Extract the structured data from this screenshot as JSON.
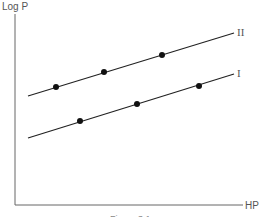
{
  "chart_data": {
    "type": "line",
    "title": "",
    "xlabel": "HP",
    "ylabel": "Log P",
    "grid": false,
    "legend": "inline labels at line ends",
    "series": [
      {
        "name": "II",
        "line": {
          "x1": 28,
          "y1": 96,
          "x2": 234,
          "y2": 33
        },
        "points": [
          [
            56,
            87
          ],
          [
            104,
            72
          ],
          [
            162,
            55
          ]
        ]
      },
      {
        "name": "I",
        "line": {
          "x1": 28,
          "y1": 138,
          "x2": 234,
          "y2": 74
        },
        "points": [
          [
            80,
            121
          ],
          [
            137,
            104
          ],
          [
            199,
            86
          ]
        ]
      }
    ],
    "caption": "Figure 3.1"
  },
  "colors": {
    "axis": "#666666",
    "line": "#222222",
    "point": "#111111"
  }
}
